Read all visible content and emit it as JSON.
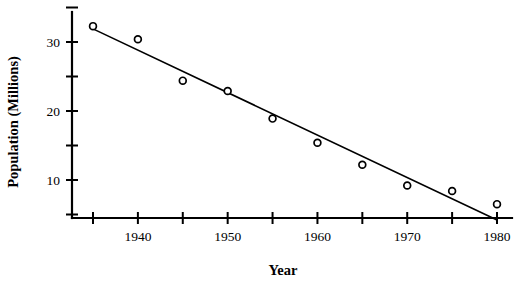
{
  "chart_data": {
    "type": "scatter",
    "title": "",
    "xlabel": "Year",
    "ylabel": "Population (Millions)",
    "xlim": [
      1933.5,
      1981.5
    ],
    "ylim": [
      0,
      36
    ],
    "grid": false,
    "legend": null,
    "x": [
      1935,
      1940,
      1945,
      1950,
      1955,
      1960,
      1965,
      1970,
      1975,
      1980
    ],
    "values": [
      32.3,
      30.4,
      24.4,
      22.9,
      18.9,
      15.4,
      12.2,
      9.2,
      8.4,
      6.5
    ],
    "series": [
      {
        "name": "Population",
        "marker": "open-circle",
        "values": [
          32.3,
          30.4,
          24.4,
          22.9,
          18.9,
          15.4,
          12.2,
          9.2,
          8.4,
          6.5
        ]
      },
      {
        "name": "Fitted line",
        "type": "line",
        "x": [
          1935,
          1980
        ],
        "values": [
          31.9,
          4.2
        ]
      }
    ],
    "xticks": [
      1935,
      1940,
      1945,
      1950,
      1955,
      1960,
      1965,
      1970,
      1975,
      1980
    ],
    "xticklabels": [
      "",
      "1940",
      "",
      "1950",
      "",
      "1960",
      "",
      "1970",
      "",
      "1980"
    ],
    "yticks": [
      5,
      10,
      15,
      20,
      25,
      30,
      35
    ],
    "yticklabels": [
      "",
      "10",
      "",
      "20",
      "",
      "30",
      ""
    ],
    "colors": {
      "axis": "#000000",
      "marker_edge": "#000000",
      "marker_fill": "#ffffff",
      "line": "#000000",
      "background": "#ffffff"
    }
  },
  "axis_titles": {
    "x": "Year",
    "y": "Population (Millions)"
  }
}
